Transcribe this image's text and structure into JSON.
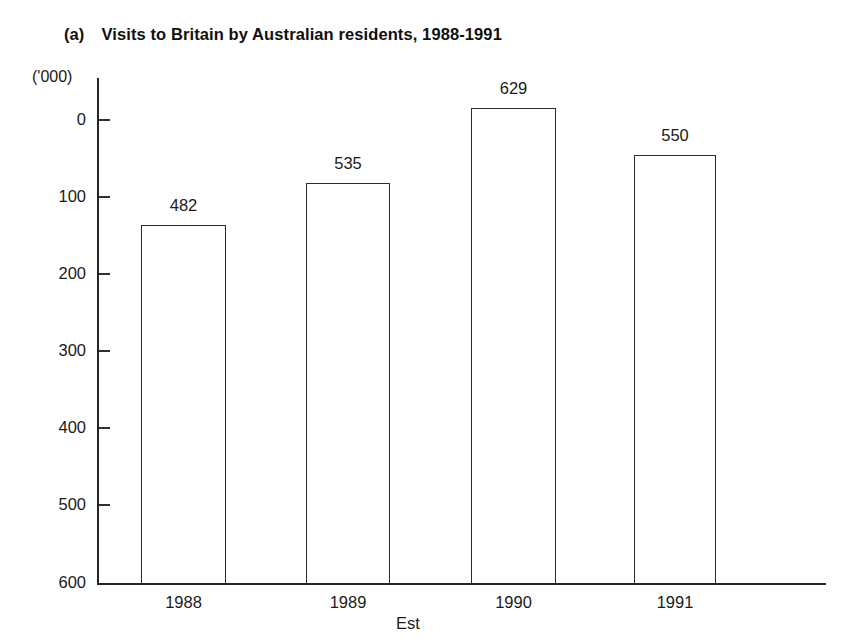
{
  "figure": {
    "panel_label": "(a)",
    "title": "Visits to Britain by Australian residents, 1988-1991",
    "unit_label": "('000)",
    "axis_note": "Est"
  },
  "chart_data": {
    "type": "bar",
    "title": "Visits to Britain by Australian residents, 1988-1991",
    "panel_label": "(a)",
    "xlabel": "Est",
    "ylabel": "('000)",
    "categories": [
      "1988",
      "1989",
      "1990",
      "1991"
    ],
    "values": [
      482,
      535,
      629,
      550
    ],
    "value_labels": [
      "482",
      "535",
      "629",
      "550"
    ],
    "ylim": [
      0,
      650
    ],
    "yticks": [
      0,
      100,
      200,
      300,
      400,
      500,
      600
    ],
    "ytick_labels": [
      "0",
      "100",
      "200",
      "300",
      "400",
      "500",
      "600"
    ],
    "grid": false,
    "legend": "none",
    "bar_fill": "#ffffff",
    "bar_edge": "#2a2a2a",
    "series": [
      {
        "name": "Visits to Britain by Australian residents",
        "values": [
          482,
          535,
          629,
          550
        ]
      }
    ]
  },
  "geometry": {
    "y_tick_px": [
      120,
      197,
      274,
      351,
      428,
      505,
      583
    ],
    "bars_px": [
      {
        "left": 141,
        "right": 226,
        "top": 225
      },
      {
        "left": 306,
        "right": 390,
        "top": 183
      },
      {
        "left": 471,
        "right": 556,
        "top": 108
      },
      {
        "left": 634,
        "right": 716,
        "top": 155
      }
    ],
    "baseline_px": 583
  }
}
